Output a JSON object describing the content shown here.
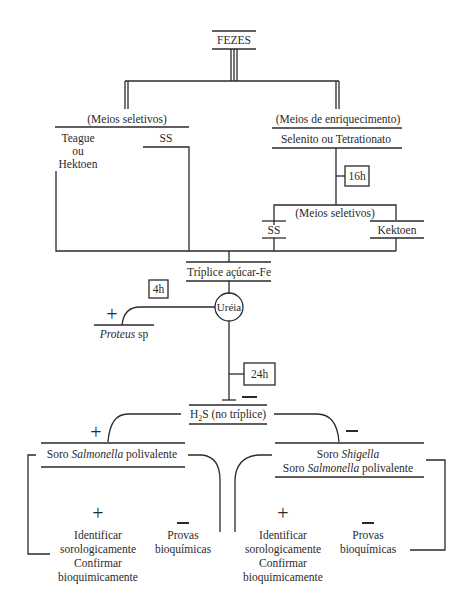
{
  "root": {
    "label": "FEZES"
  },
  "left_branch": {
    "heading": "(Meios seletivos)",
    "teague": "Teague",
    "ou": "ou",
    "hektoen": "Hektoen",
    "ss": "SS"
  },
  "right_branch": {
    "heading": "(Meios de enriquecimento)",
    "media": "Selenito ou Tetrationato",
    "time": "16h",
    "sub_heading": "(Meios seletivos)",
    "ss": "SS",
    "kektoen": "Kektoen"
  },
  "triplice": {
    "label": "Tríplice açúcar-Fe",
    "time": "4h"
  },
  "ureia": {
    "label": "Uréia",
    "positive": "+",
    "proteus_italic": "Proteus",
    "proteus_rest": " sp",
    "time": "24h",
    "negative": "−"
  },
  "h2s": {
    "label_h": "H",
    "label_sub": "2",
    "label_rest": "S (no tríplice)",
    "positive": "+",
    "negative": "−"
  },
  "salmonella_branch": {
    "soro_prefix": "Soro ",
    "soro_italic": "Salmonella",
    "soro_suffix": " polivalente",
    "positive": "+",
    "pos_lines": [
      "Identificar",
      "sorologicamente",
      "Confirmar",
      "bioquimicamente"
    ],
    "negative": "−",
    "neg_lines": [
      "Provas",
      "bioquímicas"
    ]
  },
  "shigella_branch": {
    "line1_prefix": "Soro ",
    "line1_italic": "Shigella",
    "line2_prefix": "Soro ",
    "line2_italic": "Salmonella",
    "line2_suffix": " polivalente",
    "positive": "+",
    "pos_lines": [
      "Identificar",
      "sorologicamente",
      "Confirmar",
      "bioquimicamente"
    ],
    "negative": "−",
    "neg_lines": [
      "Provas",
      "bioquímicas"
    ]
  }
}
